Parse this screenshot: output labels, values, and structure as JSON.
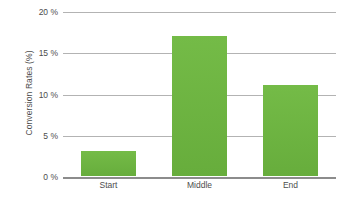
{
  "chart_data": {
    "type": "bar",
    "title": "",
    "subtitle": "",
    "categories": [
      "Start",
      "Middle",
      "End"
    ],
    "values": [
      3,
      17,
      11
    ],
    "series": [
      {
        "name": "Conversion Rates",
        "values": [
          3,
          17,
          11
        ]
      }
    ],
    "xlabel": "",
    "ylabel": "Conversion Rates (%)",
    "ylim": [
      0,
      20
    ],
    "y_ticks": [
      0,
      5,
      10,
      15,
      20
    ],
    "y_tick_labels": [
      "0 %",
      "5 %",
      "10 %",
      "15 %",
      "20 %"
    ],
    "x_tick_labels": [
      "Start",
      "Middle",
      "End"
    ],
    "grid": true,
    "grid_axis": "y",
    "legend": false,
    "legend_position": "none",
    "bar_color": "#6cb33f",
    "gridline_color": "#b3b3b3",
    "axis_color": "#8c8c8c",
    "background_color": "#ffffff",
    "text_color": "#4d4d4d",
    "annotations": []
  },
  "caption": {
    "text": ""
  }
}
